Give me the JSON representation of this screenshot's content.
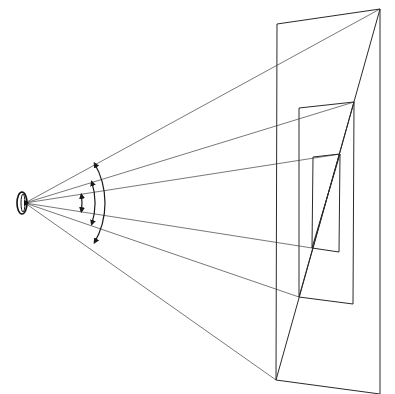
{
  "diagram": {
    "width": 395,
    "height": 394,
    "background": "#ffffff",
    "stroke_color": "#2a2a2a",
    "ray_color": "#555555",
    "eye": {
      "cx": 22,
      "cy": 203,
      "rx": 5,
      "ry": 11
    },
    "planes": [
      {
        "name": "large",
        "points": [
          [
            277,
            24
          ],
          [
            380,
            9
          ],
          [
            380,
            394
          ],
          [
            276,
            380
          ]
        ],
        "rays_to": [
          [
            380,
            9
          ],
          [
            276,
            380
          ]
        ]
      },
      {
        "name": "medium",
        "points": [
          [
            299,
            108
          ],
          [
            354,
            102
          ],
          [
            353,
            304
          ],
          [
            299,
            297
          ]
        ],
        "rays_to": [
          [
            354,
            102
          ],
          [
            299,
            297
          ]
        ]
      },
      {
        "name": "small",
        "points": [
          [
            313,
            157
          ],
          [
            340,
            154
          ],
          [
            339,
            252
          ],
          [
            312,
            248
          ]
        ],
        "rays_to": [
          [
            340,
            154
          ],
          [
            312,
            248
          ]
        ]
      }
    ],
    "diagonals": [
      [
        [
          380,
          9
        ],
        [
          276,
          380
        ]
      ],
      [
        [
          354,
          102
        ],
        [
          299,
          297
        ]
      ],
      [
        [
          340,
          154
        ],
        [
          312,
          248
        ]
      ]
    ],
    "angle_arcs": [
      {
        "name": "large-angle",
        "r": 80,
        "start_deg": -30,
        "end_deg": 30
      },
      {
        "name": "medium-angle",
        "r": 70,
        "start_deg": -18,
        "end_deg": 18
      },
      {
        "name": "small-angle",
        "r": 57,
        "start_deg": -9,
        "end_deg": 9
      }
    ]
  }
}
